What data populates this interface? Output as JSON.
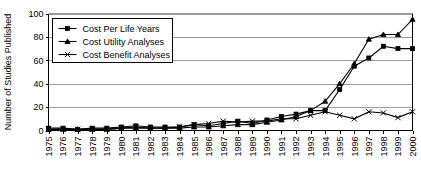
{
  "chart_data": {
    "type": "line",
    "title": "",
    "xlabel": "",
    "ylabel": "Number of Studies Published",
    "ylim": [
      0,
      100
    ],
    "yticks": [
      0,
      20,
      40,
      60,
      80,
      100
    ],
    "grid": true,
    "legend_position": "top-left",
    "categories": [
      "1975",
      "1976",
      "1977",
      "1978",
      "1979",
      "1980",
      "1981",
      "1982",
      "1983",
      "1984",
      "1985",
      "1986",
      "1987",
      "1988",
      "1989",
      "1990",
      "1991",
      "1992",
      "1993",
      "1994",
      "1995",
      "1996",
      "1997",
      "1998",
      "1999",
      "2000"
    ],
    "series": [
      {
        "name": "Cost Per Life Years",
        "marker": "square",
        "values": [
          2,
          2,
          1,
          2,
          2,
          3,
          4,
          3,
          3,
          3,
          5,
          4,
          6,
          8,
          6,
          9,
          12,
          14,
          17,
          17,
          35,
          55,
          62,
          72,
          70,
          70
        ]
      },
      {
        "name": "Cost Utility Analyses",
        "marker": "triangle",
        "values": [
          1,
          1,
          1,
          1,
          1,
          2,
          2,
          2,
          2,
          2,
          3,
          3,
          4,
          5,
          5,
          7,
          9,
          12,
          17,
          25,
          40,
          57,
          78,
          82,
          82,
          95
        ]
      },
      {
        "name": "Cost Benefit Analyses",
        "marker": "x",
        "values": [
          1,
          1,
          1,
          1,
          1,
          2,
          3,
          2,
          2,
          3,
          5,
          6,
          8,
          7,
          8,
          8,
          10,
          10,
          13,
          16,
          13,
          10,
          16,
          15,
          11,
          16
        ]
      }
    ]
  },
  "axes": {
    "y_axis_label": "Number of Studies Published"
  }
}
